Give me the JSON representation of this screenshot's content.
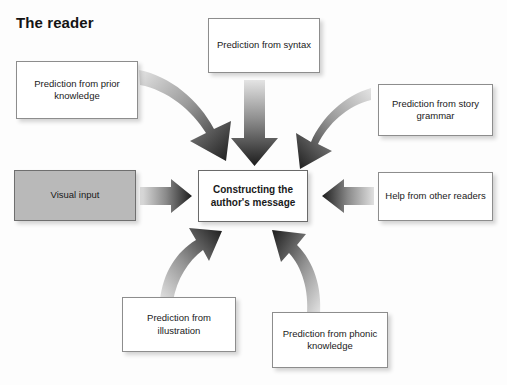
{
  "title": "The reader",
  "colors": {
    "background": "#fdfdfd",
    "box_border": "#8d8d8d",
    "box_fill": "#ffffff",
    "visual_input_fill": "#b9b9b9",
    "text": "#1a1a1a",
    "arrow_dark": "#1c1c1c",
    "arrow_light": "#e2e2e2"
  },
  "nodes": {
    "prior_knowledge": "Prediction from prior knowledge",
    "syntax": "Prediction from syntax",
    "story_grammar": "Prediction from story grammar",
    "visual_input": "Visual input",
    "center": "Constructing the author's message",
    "other_readers": "Help from other readers",
    "illustration": "Prediction from illustration",
    "phonic_knowledge": "Prediction from phonic knowledge"
  },
  "arrows": [
    {
      "name": "arrow-prior-knowledge-to-center",
      "from": "prior_knowledge",
      "to": "center",
      "shape": "curved",
      "direction": "down-right"
    },
    {
      "name": "arrow-syntax-to-center",
      "from": "syntax",
      "to": "center",
      "shape": "straight",
      "direction": "down"
    },
    {
      "name": "arrow-story-grammar-to-center",
      "from": "story_grammar",
      "to": "center",
      "shape": "curved",
      "direction": "down-left"
    },
    {
      "name": "arrow-visual-input-to-center",
      "from": "visual_input",
      "to": "center",
      "shape": "straight",
      "direction": "right"
    },
    {
      "name": "arrow-other-readers-to-center",
      "from": "other_readers",
      "to": "center",
      "shape": "straight",
      "direction": "left"
    },
    {
      "name": "arrow-illustration-to-center",
      "from": "illustration",
      "to": "center",
      "shape": "curved",
      "direction": "up-right"
    },
    {
      "name": "arrow-phonic-knowledge-to-center",
      "from": "phonic_knowledge",
      "to": "center",
      "shape": "curved",
      "direction": "up-left"
    }
  ]
}
